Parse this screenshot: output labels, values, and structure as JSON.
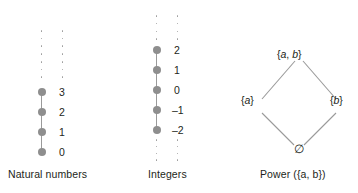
{
  "figure": {
    "background_color": "#ffffff",
    "node_color": "#8e8e8e",
    "edge_color": "#9a9a9a",
    "text_color": "#231f20"
  },
  "panels": {
    "natural": {
      "caption": "Natural numbers",
      "labels": [
        "3",
        "2",
        "1",
        "0"
      ],
      "node_count": 4,
      "ellipsis_above": true,
      "ellipsis_below": false
    },
    "integers": {
      "caption": "Integers",
      "labels": [
        "2",
        "1",
        "0",
        "–1",
        "–2"
      ],
      "node_count": 5,
      "ellipsis_above": true,
      "ellipsis_below": true
    },
    "power": {
      "caption_prefix": "Power (",
      "caption_set": "{a, b}",
      "caption_suffix": ")",
      "caption_full": "Power ({a, b})",
      "top_node": "{a, b}",
      "left_node": "{a}",
      "right_node": "{b}",
      "bottom_node": "∅",
      "top_label_a": "a",
      "top_label_b": "b",
      "left_label_a": "a",
      "right_label_b": "b"
    }
  },
  "chart_data": {
    "type": "diagram",
    "title": "",
    "subfigures": [
      {
        "name": "Natural numbers",
        "kind": "hasse-chain",
        "elements": [
          "0",
          "1",
          "2",
          "3",
          "⋮"
        ],
        "order": "0 < 1 < 2 < 3 < ...",
        "unbounded": "above"
      },
      {
        "name": "Integers",
        "kind": "hasse-chain",
        "elements": [
          "⋮",
          "–2",
          "–1",
          "0",
          "1",
          "2",
          "⋮"
        ],
        "order": "... < –2 < –1 < 0 < 1 < 2 < ...",
        "unbounded": "both"
      },
      {
        "name": "Power ({a, b})",
        "kind": "hasse-lattice",
        "elements": [
          "∅",
          "{a}",
          "{b}",
          "{a, b}"
        ],
        "covers": [
          [
            "∅",
            "{a}"
          ],
          [
            "∅",
            "{b}"
          ],
          [
            "{a}",
            "{a, b}"
          ],
          [
            "{b}",
            "{a, b}"
          ]
        ],
        "levels": [
          [
            "∅"
          ],
          [
            "{a}",
            "{b}"
          ],
          [
            "{a, b}"
          ]
        ]
      }
    ]
  }
}
